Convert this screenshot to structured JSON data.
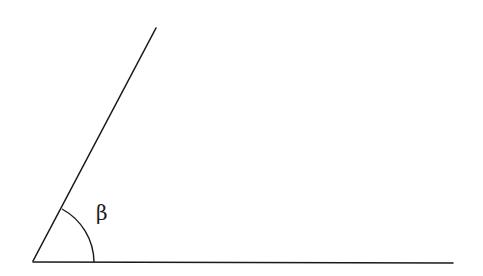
{
  "diagram": {
    "type": "angle",
    "angle_label": "β",
    "elements": [
      "ray-slanted",
      "ray-horizontal",
      "angle-arc",
      "angle-label"
    ],
    "stroke_color": "#1a1a1a",
    "background_color": "#ffffff"
  }
}
